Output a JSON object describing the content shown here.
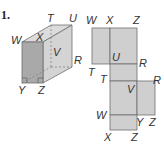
{
  "problem": {
    "number": "1."
  },
  "colors": {
    "front_face": "#a9a9a9",
    "side_face": "#d4d4d4",
    "top_face": "#dcdcdc",
    "net_fill": "#cfcfcf",
    "stroke": "#6e6e6e",
    "label": "#333333"
  },
  "prism": {
    "labels": {
      "T": "T",
      "U": "U",
      "W": "W",
      "X": "X",
      "V": "V",
      "R": "R",
      "Y": "Y",
      "Z": "Z"
    }
  },
  "net": {
    "labels": {
      "top_W": "W",
      "top_X": "X",
      "top_Z": "Z",
      "U": "U",
      "R_upper": "R",
      "T_left": "T",
      "T_inner": "T",
      "V": "V",
      "R_right": "R",
      "W_lower": "W",
      "Y": "Y",
      "Z_right": "Z",
      "bottom_X": "X",
      "bottom_Z": "Z"
    }
  }
}
